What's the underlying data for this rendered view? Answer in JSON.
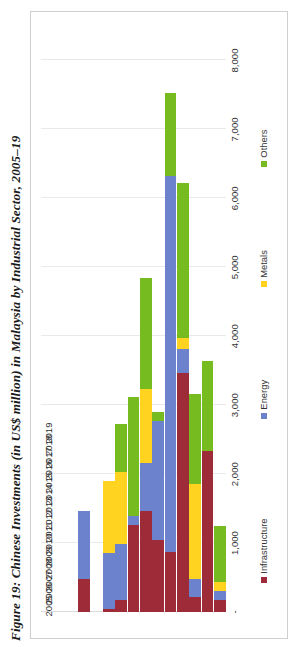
{
  "figure": {
    "title": "Figure 19: Chinese Investments (in US$ million) in Malaysia by Industrial Sector, 2005–19"
  },
  "legend": {
    "position": "bottom",
    "items": [
      {
        "label": "Infrastructure",
        "color": "#9E2B38"
      },
      {
        "label": "Energy",
        "color": "#6C82CD"
      },
      {
        "label": "Metals",
        "color": "#FFD320"
      },
      {
        "label": "Others",
        "color": "#76BC21"
      }
    ]
  },
  "axis": {
    "value_ticks": [
      "-",
      "1,000",
      "2,000",
      "3,000",
      "4,000",
      "5,000",
      "6,000",
      "7,000",
      "8,000"
    ],
    "category_ticks": [
      "2005",
      "2006",
      "2007",
      "2008",
      "2009",
      "2010",
      "2011",
      "2012",
      "2013",
      "2014",
      "2015",
      "2016",
      "2017",
      "2018",
      "2019"
    ]
  },
  "chart_data": {
    "type": "bar",
    "orientation": "horizontal-stacked",
    "title": "Figure 19: Chinese Investments (in US$ million) in Malaysia by Industrial Sector, 2005–19",
    "xlabel": "",
    "ylabel": "",
    "xlim": [
      0,
      8500
    ],
    "grid": true,
    "unit": "US$ million",
    "categories": [
      "2005",
      "2006",
      "2007",
      "2008",
      "2009",
      "2010",
      "2011",
      "2012",
      "2013",
      "2014",
      "2015",
      "2016",
      "2017",
      "2018",
      "2019"
    ],
    "series": [
      {
        "name": "Infrastructure",
        "color": "#9E2B38",
        "values": [
          0,
          0,
          0,
          480,
          0,
          40,
          170,
          1260,
          1470,
          1040,
          870,
          3460,
          220,
          2340,
          170
        ]
      },
      {
        "name": "Energy",
        "color": "#6C82CD",
        "values": [
          0,
          0,
          0,
          990,
          0,
          820,
          820,
          130,
          690,
          1730,
          5450,
          350,
          260,
          0,
          130
        ]
      },
      {
        "name": "Metals",
        "color": "#FFD320",
        "values": [
          0,
          0,
          0,
          0,
          0,
          1040,
          1040,
          0,
          1080,
          0,
          0,
          170,
          1380,
          0,
          130
        ]
      },
      {
        "name": "Others",
        "color": "#76BC21",
        "values": [
          0,
          0,
          0,
          0,
          0,
          0,
          690,
          1730,
          1600,
          130,
          1210,
          2250,
          1300,
          1300,
          820
        ]
      }
    ]
  }
}
